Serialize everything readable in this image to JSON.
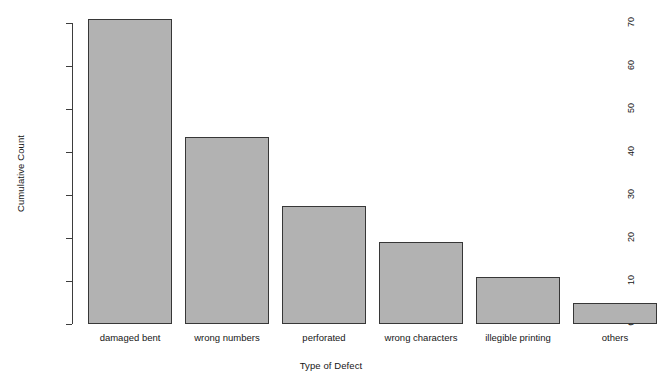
{
  "chart_data": {
    "type": "bar",
    "title": "",
    "xlabel": "Type of Defect",
    "ylabel": "Cumulative Count",
    "categories": [
      "damaged bent",
      "wrong numbers",
      "perforated",
      "wrong characters",
      "illegible printing",
      "others"
    ],
    "values": [
      71,
      43.5,
      27.5,
      19,
      11,
      5
    ],
    "ylim": [
      0,
      71
    ],
    "yticks": [
      0,
      10,
      20,
      30,
      40,
      50,
      60,
      70
    ],
    "ytick_labels": [
      "0",
      "10",
      "20",
      "30",
      "40",
      "50",
      "60",
      "70"
    ],
    "grid": false,
    "legend": null,
    "bar_color": "#b2b2b2",
    "bar_border_color": "#373737",
    "axis_color": "#3d3d3d",
    "background": "#ffffff"
  }
}
